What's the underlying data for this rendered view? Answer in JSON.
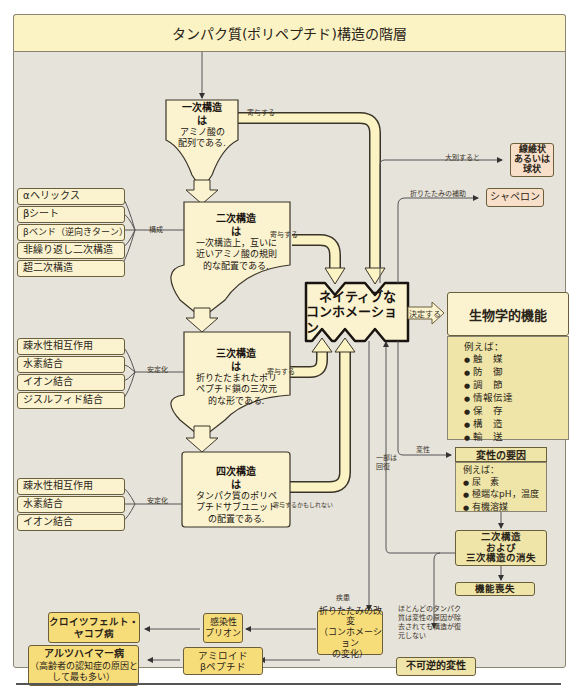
{
  "title": "タンパク質(ポリペプチド)構造の階層",
  "primary": {
    "heading": "一次構造",
    "is": "は",
    "lines": [
      "アミノ酸の",
      "配列である."
    ],
    "contributes": "寄与する"
  },
  "secondary": {
    "heading": "二次構造",
    "is": "は",
    "lines": [
      "一次構造上，互いに",
      "近いアミノ酸の規則",
      "的な配置である."
    ],
    "contributes": "寄与する",
    "relation": "構成",
    "components": [
      "αヘリックス",
      "βシート",
      "βベンド（逆向きターン）",
      "非繰り返し二次構造",
      "超二次構造"
    ]
  },
  "tertiary": {
    "heading": "三次構造",
    "is": "は",
    "lines": [
      "折りたたまれたポリ",
      "ペプチド鎖の三次元",
      "的な形である."
    ],
    "contributes": "寄与する",
    "relation": "安定化",
    "components": [
      "疎水性相互作用",
      "水素結合",
      "イオン結合",
      "ジスルフィド結合"
    ]
  },
  "quaternary": {
    "heading": "四次構造",
    "is": "は",
    "lines": [
      "タンパク質のポリペ",
      "プチドサブユニット",
      "の配置である."
    ],
    "contributes": "寄与するかもしれない",
    "relation": "安定化",
    "components": [
      "疎水性相互作用",
      "水素結合",
      "イオン結合"
    ]
  },
  "native": {
    "line1": "ネイティブな",
    "line2": "コンホメーション"
  },
  "determines": "決定する",
  "classification": {
    "label": "大別すると",
    "box": [
      "線維状",
      "あるいは",
      "球状"
    ]
  },
  "chaperone": {
    "label": "折りたたみの補助",
    "box": "シャペロン"
  },
  "bio_function": {
    "title": "生物学的機能",
    "intro": "例えば：",
    "items": [
      "触　媒",
      "防　御",
      "調　節",
      "情報伝達",
      "保　存",
      "構　造",
      "輸　送"
    ]
  },
  "denaturation": {
    "label": "変性",
    "title": "変性の要因",
    "intro": "例えば：",
    "items": [
      "尿　素",
      "極端なpH，温度",
      "有機溶媒"
    ],
    "loss_structure": [
      "二次構造",
      "および",
      "三次構造の消失"
    ],
    "loss_function": "機能喪失",
    "partial_recovery": [
      "一部は",
      "回復"
    ],
    "note": [
      "ほとんどのタンパク",
      "質は変性の原因が除",
      "去されても構造が復",
      "元しない"
    ],
    "irreversible": "不可逆的変性"
  },
  "disease": {
    "label": "疾患",
    "misfold": [
      "折りたたみの改変",
      "（コンホメーション",
      "の変化）"
    ],
    "prion": [
      "感染性",
      "プリオン"
    ],
    "cjd": [
      "クロイツフェルト・",
      "ヤコブ病"
    ],
    "amyloid": [
      "アミロイド",
      "βペプチド"
    ],
    "alzheimer": [
      "アルツハイマー病",
      "（高齢者の認知症の原因と",
      "して最も多い）"
    ]
  },
  "colors": {
    "background": "#e6e3db",
    "title_bar": "#fbf3c4",
    "light_box": "#fbf3cf",
    "yellow_box": "#f7dc7a",
    "pink_box": "#f7dfc9",
    "olive_box": "#efe5a8",
    "border": "#6b5e3a"
  }
}
